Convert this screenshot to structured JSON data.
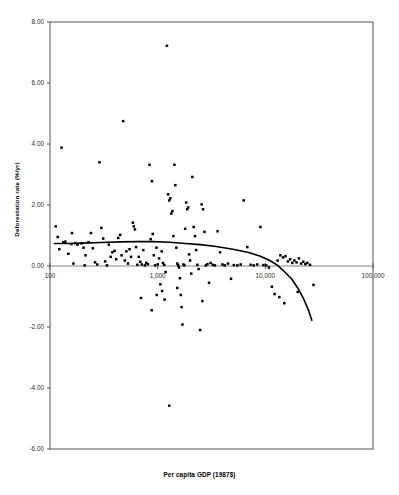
{
  "chart_data": {
    "type": "scatter",
    "title": "",
    "xlabel": "Per capita GDP (1987$)",
    "ylabel": "Deforestation rate (%/yr)",
    "xscale": "log",
    "xlim": [
      100,
      100000
    ],
    "ylim": [
      -6.0,
      8.0
    ],
    "xticks": [
      100,
      1000,
      10000,
      100000
    ],
    "xticklabels": [
      "100",
      "1,000",
      "10,000",
      "100,000"
    ],
    "yticks": [
      -6.0,
      -4.0,
      -2.0,
      0.0,
      2.0,
      4.0,
      6.0,
      8.0
    ],
    "yticklabels": [
      "-6.00",
      "-4.00",
      "-2.00",
      "0.00",
      "2.00",
      "4.00",
      "6.00",
      "8.00"
    ],
    "grid": false,
    "legend": null,
    "marker_color": "#000000",
    "curve_color": "#000000",
    "zero_line": 0.0,
    "points": [
      [
        113,
        1.3
      ],
      [
        118,
        0.95
      ],
      [
        122,
        0.55
      ],
      [
        128,
        3.88
      ],
      [
        133,
        0.78
      ],
      [
        139,
        0.8
      ],
      [
        148,
        0.4
      ],
      [
        158,
        0.72
      ],
      [
        165,
        0.08
      ],
      [
        172,
        0.75
      ],
      [
        180,
        0.7
      ],
      [
        196,
        0.74
      ],
      [
        205,
        0.6
      ],
      [
        214,
        0.35
      ],
      [
        228,
        0.78
      ],
      [
        240,
        1.08
      ],
      [
        250,
        0.58
      ],
      [
        262,
        0.12
      ],
      [
        275,
        0.05
      ],
      [
        288,
        3.4
      ],
      [
        300,
        1.25
      ],
      [
        312,
        0.9
      ],
      [
        325,
        0.15
      ],
      [
        338,
        0.02
      ],
      [
        352,
        0.7
      ],
      [
        366,
        0.3
      ],
      [
        380,
        0.45
      ],
      [
        398,
        0.5
      ],
      [
        412,
        0.22
      ],
      [
        430,
        0.92
      ],
      [
        448,
        1.02
      ],
      [
        462,
        0.35
      ],
      [
        478,
        4.75
      ],
      [
        495,
        0.18
      ],
      [
        512,
        0.48
      ],
      [
        530,
        0.08
      ],
      [
        548,
        0.55
      ],
      [
        566,
        0.3
      ],
      [
        588,
        1.42
      ],
      [
        600,
        1.3
      ],
      [
        615,
        1.2
      ],
      [
        630,
        0.62
      ],
      [
        648,
        0.04
      ],
      [
        668,
        0.3
      ],
      [
        690,
        0.14
      ],
      [
        712,
        0.05
      ],
      [
        735,
        0.52
      ],
      [
        760,
        0.02
      ],
      [
        785,
        0.1
      ],
      [
        812,
        0.06
      ],
      [
        840,
        3.32
      ],
      [
        862,
        0.88
      ],
      [
        885,
        2.78
      ],
      [
        900,
        1.05
      ],
      [
        920,
        0.35
      ],
      [
        945,
        0.02
      ],
      [
        975,
        0.6
      ],
      [
        1000,
        0.05
      ],
      [
        1030,
        0.25
      ],
      [
        1060,
        -0.6
      ],
      [
        1090,
        0.48
      ],
      [
        1120,
        0.1
      ],
      [
        1150,
        0.04
      ],
      [
        1185,
        -0.2
      ],
      [
        1220,
        7.22
      ],
      [
        1250,
        2.35
      ],
      [
        1280,
        2.15
      ],
      [
        1310,
        2.22
      ],
      [
        1340,
        1.72
      ],
      [
        1370,
        1.8
      ],
      [
        1400,
        0.98
      ],
      [
        1430,
        3.32
      ],
      [
        1460,
        2.65
      ],
      [
        1490,
        0.6
      ],
      [
        1520,
        0.08
      ],
      [
        1550,
        0.02
      ],
      [
        1580,
        -0.05
      ],
      [
        1610,
        -0.4
      ],
      [
        1640,
        -0.95
      ],
      [
        1670,
        -1.35
      ],
      [
        1700,
        -1.92
      ],
      [
        1735,
        0.05
      ],
      [
        1770,
        0.02
      ],
      [
        1800,
        1.22
      ],
      [
        1840,
        2.08
      ],
      [
        1880,
        1.86
      ],
      [
        1920,
        1.92
      ],
      [
        1960,
        0.38
      ],
      [
        2000,
        0.18
      ],
      [
        2050,
        -0.25
      ],
      [
        2100,
        2.92
      ],
      [
        2160,
        1.28
      ],
      [
        2220,
        0.98
      ],
      [
        2280,
        0.52
      ],
      [
        2340,
        0.04
      ],
      [
        2400,
        -0.1
      ],
      [
        2480,
        -2.1
      ],
      [
        2560,
        2.02
      ],
      [
        2640,
        1.86
      ],
      [
        2720,
        1.12
      ],
      [
        2800,
        0.02
      ],
      [
        2900,
        0.06
      ],
      [
        3000,
        -0.55
      ],
      [
        3100,
        0.1
      ],
      [
        3250,
        0.04
      ],
      [
        3400,
        0.02
      ],
      [
        3600,
        1.14
      ],
      [
        3800,
        0.45
      ],
      [
        4000,
        0.05
      ],
      [
        4200,
        0.02
      ],
      [
        4500,
        0.08
      ],
      [
        4800,
        -0.42
      ],
      [
        5100,
        0.03
      ],
      [
        5500,
        0.02
      ],
      [
        5900,
        0.05
      ],
      [
        6300,
        2.15
      ],
      [
        6800,
        0.62
      ],
      [
        7300,
        0.04
      ],
      [
        7800,
        0.02
      ],
      [
        8400,
        0.05
      ],
      [
        9000,
        1.28
      ],
      [
        9600,
        0.03
      ],
      [
        10200,
        0.02
      ],
      [
        10800,
        -0.05
      ],
      [
        11500,
        -0.68
      ],
      [
        12200,
        -0.92
      ],
      [
        13000,
        0.18
      ],
      [
        13800,
        0.35
      ],
      [
        14600,
        0.28
      ],
      [
        15400,
        0.32
      ],
      [
        16200,
        0.15
      ],
      [
        17000,
        0.22
      ],
      [
        17800,
        0.1
      ],
      [
        18600,
        0.18
      ],
      [
        19500,
        0.12
      ],
      [
        20500,
        0.25
      ],
      [
        21500,
        0.08
      ],
      [
        22500,
        0.14
      ],
      [
        23500,
        0.06
      ],
      [
        24500,
        0.1
      ],
      [
        26000,
        0.04
      ],
      [
        28000,
        -0.62
      ],
      [
        1280,
        -4.58
      ],
      [
        13500,
        -1.02
      ],
      [
        15000,
        -1.22
      ],
      [
        20000,
        -0.85
      ],
      [
        700,
        -1.05
      ],
      [
        880,
        -1.45
      ],
      [
        1100,
        -0.82
      ],
      [
        2600,
        -1.15
      ],
      [
        160,
        1.08
      ],
      [
        210,
        0.02
      ],
      [
        980,
        -0.95
      ],
      [
        1160,
        -1.1
      ],
      [
        1520,
        -0.72
      ]
    ],
    "trend_curve": {
      "description": "fitted quadratic trend in log(GDP)",
      "points": [
        [
          110,
          0.74
        ],
        [
          150,
          0.74
        ],
        [
          200,
          0.75
        ],
        [
          300,
          0.77
        ],
        [
          450,
          0.79
        ],
        [
          650,
          0.8
        ],
        [
          900,
          0.8
        ],
        [
          1300,
          0.78
        ],
        [
          1800,
          0.74
        ],
        [
          2500,
          0.7
        ],
        [
          3500,
          0.64
        ],
        [
          5000,
          0.55
        ],
        [
          7000,
          0.44
        ],
        [
          9000,
          0.32
        ],
        [
          11000,
          0.18
        ],
        [
          13000,
          0.02
        ],
        [
          15000,
          -0.18
        ],
        [
          17500,
          -0.42
        ],
        [
          20000,
          -0.72
        ],
        [
          22500,
          -1.05
        ],
        [
          25000,
          -1.42
        ],
        [
          27000,
          -1.78
        ]
      ]
    }
  },
  "axis": {
    "ylabel_text": "Deforestation rate (%/yr)",
    "xlabel_text": "Per capita GDP (1987$)"
  }
}
